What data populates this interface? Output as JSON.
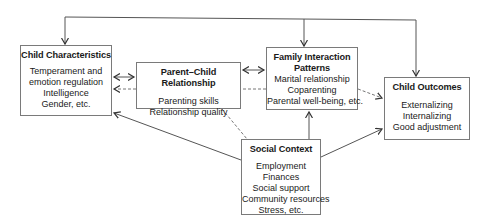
{
  "diagram": {
    "nodes": {
      "child_characteristics": {
        "title": "Child Characteristics",
        "items": [
          "Temperament and",
          "emotion regulation",
          "Intelligence",
          "Gender, etc."
        ]
      },
      "parent_child_relationship": {
        "title": "Parent–Child Relationship",
        "items": [
          "Parenting skills",
          "Relationship quality"
        ]
      },
      "family_interaction_patterns": {
        "title_line1": "Family Interaction",
        "title_line2": "Patterns",
        "items": [
          "Marital relationship",
          "Coparenting",
          "Parental well-being, etc."
        ]
      },
      "child_outcomes": {
        "title": "Child Outcomes",
        "items": [
          "Externalizing",
          "Internalizing",
          "Good adjustment"
        ]
      },
      "social_context": {
        "title": "Social Context",
        "items": [
          "Employment",
          "Finances",
          "Social support",
          "Community resources",
          "Stress, etc."
        ]
      }
    },
    "edges": [
      {
        "from": "top-bus",
        "to": "child_characteristics",
        "style": "solid",
        "arrow": "end"
      },
      {
        "from": "top-bus",
        "to": "family_interaction_patterns",
        "style": "solid",
        "arrow": "end"
      },
      {
        "from": "top-bus",
        "to": "child_outcomes",
        "style": "solid",
        "arrow": "end"
      },
      {
        "from": "child_characteristics",
        "to": "parent_child_relationship",
        "style": "solid",
        "arrow": "both"
      },
      {
        "from": "parent_child_relationship",
        "to": "family_interaction_patterns",
        "style": "solid",
        "arrow": "both"
      },
      {
        "from": "family_interaction_patterns",
        "to": "child_characteristics",
        "style": "dashed",
        "arrow": "end"
      },
      {
        "from": "family_interaction_patterns",
        "to": "child_outcomes",
        "style": "dashed",
        "arrow": "end"
      },
      {
        "from": "social_context",
        "to": "child_characteristics",
        "style": "solid",
        "arrow": "end"
      },
      {
        "from": "social_context",
        "to": "family_interaction_patterns",
        "style": "solid",
        "arrow": "end"
      },
      {
        "from": "social_context",
        "to": "child_outcomes",
        "style": "solid",
        "arrow": "end"
      },
      {
        "from": "parent_child_relationship",
        "to": "social_context",
        "style": "dashed",
        "arrow": "none"
      }
    ],
    "colors": {
      "line": "#555555",
      "border": "#7a7a7a",
      "text": "#1a1a1a"
    }
  }
}
